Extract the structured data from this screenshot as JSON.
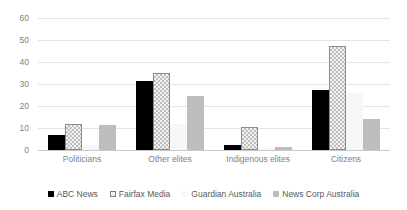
{
  "chart_data": {
    "type": "bar",
    "title": "",
    "subtitle": "",
    "xlabel": "",
    "ylabel": "",
    "ylim": [
      0,
      60
    ],
    "yticks": [
      0,
      10,
      20,
      30,
      40,
      50,
      60
    ],
    "grid": true,
    "legend_position": "bottom",
    "categories": [
      "Politicians",
      "Other elites",
      "Indigenous elites",
      "Citizens"
    ],
    "series": [
      {
        "name": "ABC News",
        "color": "#000000",
        "pattern": "solid",
        "values": [
          7,
          31.5,
          2.5,
          27.5
        ]
      },
      {
        "name": "Fairfax Media",
        "color": "#f2f2f2",
        "pattern": "checkered",
        "values": [
          12,
          35,
          10.5,
          47.5
        ]
      },
      {
        "name": "Guardian Australia",
        "color": "#f7f7f7",
        "pattern": "solid",
        "values": [
          2.5,
          12,
          1,
          26
        ]
      },
      {
        "name": "News Corp Australia",
        "color": "#bdbdbd",
        "pattern": "solid",
        "values": [
          11.5,
          24.5,
          1.5,
          14
        ]
      }
    ]
  }
}
